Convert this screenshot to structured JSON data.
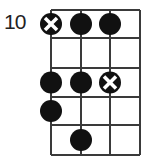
{
  "diagram": {
    "type": "bass-scale-fretboard",
    "start_fret_label": "10",
    "strings": 4,
    "frets": 5,
    "grid": {
      "x": [
        51,
        81,
        110,
        140
      ],
      "y": [
        10,
        38,
        68,
        97,
        125,
        155
      ]
    },
    "colors": {
      "line": "#3a3a3a",
      "dot": "#111111",
      "root_mark": "#ffffff"
    },
    "notes": [
      {
        "string": 1,
        "fret": 1,
        "root": true
      },
      {
        "string": 2,
        "fret": 1,
        "root": false
      },
      {
        "string": 3,
        "fret": 1,
        "root": false
      },
      {
        "string": 1,
        "fret": 3,
        "root": false
      },
      {
        "string": 2,
        "fret": 3,
        "root": false
      },
      {
        "string": 3,
        "fret": 3,
        "root": true
      },
      {
        "string": 1,
        "fret": 4,
        "root": false
      },
      {
        "string": 2,
        "fret": 5,
        "root": false
      }
    ]
  }
}
